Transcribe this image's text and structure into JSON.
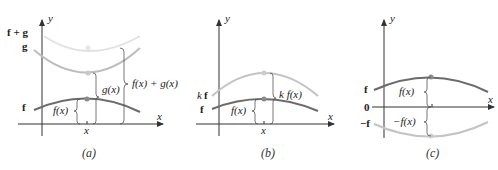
{
  "colors": {
    "axis": "#333333",
    "f_curve": "#6b6b6b",
    "g_curve": "#bdbdbd",
    "fg_curve": "#e2e2e2",
    "kf_curve": "#c4c4c4",
    "neg_f_curve": "#c4c4c4",
    "brace": "#555555",
    "text": "#222222"
  },
  "panels": [
    {
      "caption": "(a)",
      "axis_labels": {
        "x": "x",
        "y": "y"
      },
      "curve_labels": {
        "f": "f",
        "g": "g",
        "fg": "f + g"
      },
      "brace_labels": {
        "f": "f(x)",
        "g": "g(x)",
        "fg": "f(x) + g(x)"
      },
      "tick_label": "x"
    },
    {
      "caption": "(b)",
      "axis_labels": {
        "x": "x",
        "y": "y"
      },
      "curve_labels": {
        "f": "f",
        "kf_k": "k",
        "kf_f": "f"
      },
      "brace_labels": {
        "f": "f(x)",
        "kf": "k f(x)"
      },
      "tick_label": "x"
    },
    {
      "caption": "(c)",
      "axis_labels": {
        "x": "x",
        "y": "y"
      },
      "curve_labels": {
        "f": "f",
        "zero": "0",
        "neg_f": "−f"
      },
      "brace_labels": {
        "f": "f(x)",
        "neg_f": "−f(x)"
      }
    }
  ]
}
